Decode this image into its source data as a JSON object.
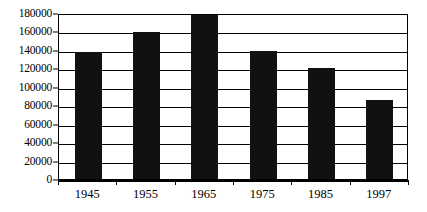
{
  "chart_data": {
    "type": "bar",
    "title": "",
    "subtitle": "",
    "xlabel": "",
    "ylabel": "",
    "categories": [
      "1945",
      "1955",
      "1965",
      "1975",
      "1985",
      "1997"
    ],
    "values": [
      138000,
      159000,
      180000,
      139000,
      120000,
      86000
    ],
    "series": [
      {
        "name": "",
        "values": [
          138000,
          159000,
          180000,
          139000,
          120000,
          86000
        ]
      }
    ],
    "ylim": [
      0,
      180000
    ],
    "ytick_values": [
      0,
      20000,
      40000,
      60000,
      80000,
      100000,
      120000,
      140000,
      160000,
      180000
    ],
    "ytick_labels": [
      "0",
      "20000",
      "40000",
      "60000",
      "80000",
      "100000",
      "120000",
      "140000",
      "160000",
      "180000"
    ],
    "xtick_labels": [
      "1945",
      "1955",
      "1965",
      "1975",
      "1985",
      "1997"
    ],
    "grid": true,
    "grid_axis": "y",
    "legend": false,
    "legend_position": "none",
    "bar_color": "#111111",
    "background_color": "#ffffff",
    "axis_color": "#000000",
    "annotations": []
  }
}
